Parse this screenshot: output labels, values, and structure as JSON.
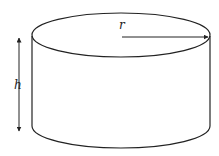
{
  "diagram": {
    "type": "cylinder",
    "labels": {
      "radius": "r",
      "height": "h"
    },
    "colors": {
      "stroke": "#222222",
      "background": "#ffffff"
    }
  }
}
